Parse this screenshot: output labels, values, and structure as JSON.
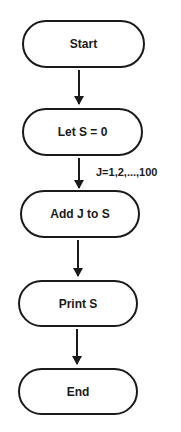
{
  "diagram": {
    "type": "flowchart",
    "nodes": [
      {
        "id": "start",
        "label": "Start",
        "shape": "terminal"
      },
      {
        "id": "init",
        "label": "Let S = 0",
        "shape": "terminal"
      },
      {
        "id": "add",
        "label": "Add J to S",
        "shape": "terminal"
      },
      {
        "id": "print",
        "label": "Print S",
        "shape": "terminal"
      },
      {
        "id": "end",
        "label": "End",
        "shape": "terminal"
      }
    ],
    "edges": [
      {
        "from": "start",
        "to": "init",
        "label": ""
      },
      {
        "from": "init",
        "to": "add",
        "label": "J=1,2,...,100"
      },
      {
        "from": "add",
        "to": "print",
        "label": ""
      },
      {
        "from": "print",
        "to": "end",
        "label": ""
      }
    ],
    "caption": "Figure ... (cropped)"
  }
}
